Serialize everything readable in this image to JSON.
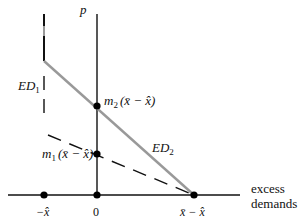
{
  "diagram": {
    "type": "excess-demand-diagram",
    "colors": {
      "axis": "#111111",
      "ed1": "#111111",
      "ed2": "#999999",
      "point": "#000000"
    },
    "axis_labels": {
      "y": "p",
      "x_line1": "excess",
      "x_line2": "demands"
    },
    "tick_labels": {
      "neg_xhat": "−x̂",
      "zero": "0",
      "xbar_minus_xhat": "x̄ − x̂"
    },
    "curves": {
      "ed1": {
        "label": "ED",
        "sub": "1",
        "style": "dashed"
      },
      "ed2": {
        "label": "ED",
        "sub": "2",
        "style": "solid-gray"
      }
    },
    "points": {
      "m2": {
        "label": "m",
        "sub": "2",
        "arg": "(x̄ − x̂)"
      },
      "m1": {
        "label": "m",
        "sub": "1",
        "arg": "(x̄ − x̂)"
      }
    }
  }
}
